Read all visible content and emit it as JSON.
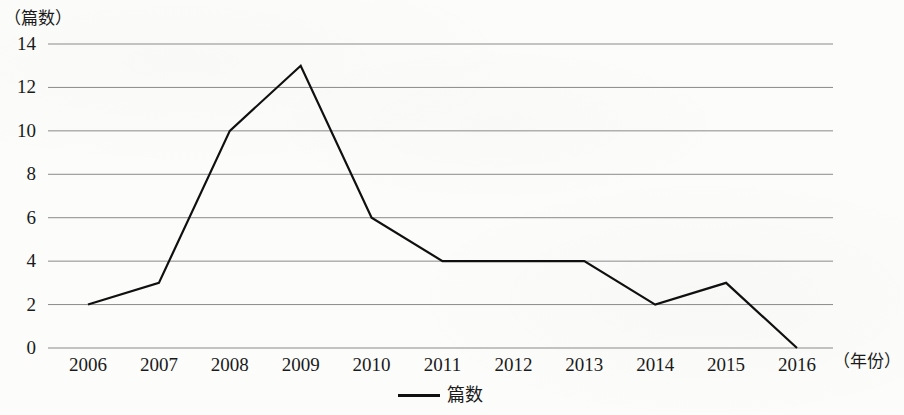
{
  "chart_data": {
    "type": "line",
    "title": "",
    "subtitle": "",
    "xlabel": "（年份）",
    "ylabel": "（篇数）",
    "categories": [
      "2006",
      "2007",
      "2008",
      "2009",
      "2010",
      "2011",
      "2012",
      "2013",
      "2014",
      "2015",
      "2016"
    ],
    "series": [
      {
        "name": "篇数",
        "values": [
          2,
          3,
          10,
          13,
          6,
          4,
          4,
          4,
          2,
          3,
          0
        ],
        "color": "#101010"
      }
    ],
    "ylim": [
      0,
      14
    ],
    "ytick_labels": [
      "0",
      "2",
      "4",
      "6",
      "8",
      "10",
      "12",
      "14"
    ],
    "ytick_values": [
      0,
      2,
      4,
      6,
      8,
      10,
      12,
      14
    ],
    "grid": true,
    "grid_axis": "y",
    "grid_color": "#8a8a8a",
    "legend": {
      "position": "bottom-center",
      "entries": [
        {
          "label": "篇数",
          "marker": "line"
        }
      ]
    },
    "background_color": "#fcfcfa",
    "axis_color": "#8a8a8a"
  }
}
